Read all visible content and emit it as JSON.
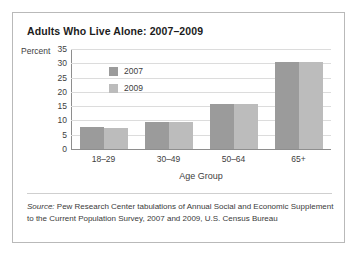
{
  "chart_data": {
    "type": "bar",
    "title": "Adults Who Live Alone: 2007–2009",
    "xlabel": "Age Group",
    "ylabel": "Percent",
    "categories": [
      "18–29",
      "30–49",
      "50–64",
      "65+"
    ],
    "series": [
      {
        "name": "2007",
        "color": "#9b9b9b",
        "values": [
          7.8,
          9.6,
          15.8,
          30.3
        ]
      },
      {
        "name": "2009",
        "color": "#bcbcbc",
        "values": [
          7.2,
          9.6,
          15.7,
          30.3
        ]
      }
    ],
    "ylim": [
      0,
      35
    ],
    "ytick_values": [
      0,
      5,
      10,
      15,
      20,
      25,
      30,
      35
    ],
    "ytick_labels": [
      "0",
      "5",
      "10",
      "15",
      "20",
      "25",
      "30",
      "35"
    ],
    "grid": true,
    "legend_position": "upper-left-inside",
    "source_note": {
      "prefix": "Source:",
      "text": " Pew Research Center tabulations of Annual Social and Economic Supplement to the Current Population Survey, 2007 and 2009, U.S. Census Bureau"
    }
  }
}
